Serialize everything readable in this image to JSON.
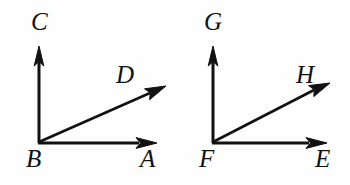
{
  "canvas": {
    "width": 350,
    "height": 185,
    "background_color": "#fefefe",
    "ink_color": "#111111"
  },
  "figures": [
    {
      "id": "angle-abc",
      "vertex_label": "B",
      "rays": [
        {
          "name": "ray-BC",
          "tip_label": "C",
          "direction": "up"
        },
        {
          "name": "ray-BA",
          "tip_label": "A",
          "direction": "right"
        },
        {
          "name": "ray-BD",
          "tip_label": "D",
          "direction": "diagonal-up-right"
        }
      ],
      "labels": {
        "C": "C",
        "D": "D",
        "B": "B",
        "A": "A"
      }
    },
    {
      "id": "angle-efg",
      "vertex_label": "F",
      "rays": [
        {
          "name": "ray-FG",
          "tip_label": "G",
          "direction": "up"
        },
        {
          "name": "ray-FE",
          "tip_label": "E",
          "direction": "right"
        },
        {
          "name": "ray-FH",
          "tip_label": "H",
          "direction": "diagonal-up-right"
        }
      ],
      "labels": {
        "G": "G",
        "H": "H",
        "F": "F",
        "E": "E"
      }
    }
  ]
}
